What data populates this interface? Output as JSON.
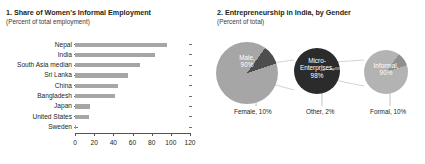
{
  "panel1": {
    "title": "1. Share of Women's Informal Employment",
    "subtitle": "(Percent of total employment)"
  },
  "panel2": {
    "title": "2. Entrepreneurship in India, by Gender",
    "subtitle": "(Percent of total)"
  },
  "chart_data": [
    {
      "type": "bar",
      "title": "1. Share of Women's Informal Employment",
      "subtitle": "(Percent of total employment)",
      "orientation": "horizontal",
      "xlabel": "",
      "ylabel": "",
      "xlim": [
        0,
        120
      ],
      "xticks": [
        0,
        20,
        40,
        60,
        80,
        100,
        120
      ],
      "grid": false,
      "legend": false,
      "bar_color": "#a6a6a6",
      "categories": [
        "Nepal",
        "India",
        "South Asia median",
        "Sri Lanka",
        "China",
        "Bangladesh",
        "Japan",
        "United States",
        "Sweden"
      ],
      "values": [
        96,
        83,
        68,
        55,
        45,
        42,
        16,
        15,
        1
      ]
    },
    {
      "type": "pie",
      "title": "2. Entrepreneurship in India, by Gender",
      "subtitle": "(Percent of total)",
      "legend": false,
      "pies": [
        {
          "name": "gender",
          "labels": [
            "Male",
            "Female"
          ],
          "values": [
            90,
            10
          ],
          "inside_label": "Male, 90%",
          "inside_label_line1": "Male,",
          "inside_label_line2": "90%",
          "callout_label": "Female, 10%",
          "colors": [
            "#a6a6a6",
            "#4d4d4d"
          ]
        },
        {
          "name": "enterprise-size",
          "labels": [
            "Micro-Enterprises",
            "Other"
          ],
          "values": [
            98,
            2
          ],
          "inside_label": "Micro-Enterprises, 98%",
          "inside_label_line1": "Micro-",
          "inside_label_line2": "Enterprises,",
          "inside_label_line3": "98%",
          "callout_label": "Other, 2%",
          "colors": [
            "#2b2b2b",
            "#6f6f6f"
          ]
        },
        {
          "name": "formality",
          "labels": [
            "Informal",
            "Formal"
          ],
          "values": [
            90,
            10
          ],
          "inside_label": "Informal, 90%",
          "inside_label_line1": "Informal,",
          "inside_label_line2": "90%",
          "callout_label": "Formal, 10%",
          "colors": [
            "#b3b3b3",
            "#8f8f8f"
          ]
        }
      ]
    }
  ]
}
